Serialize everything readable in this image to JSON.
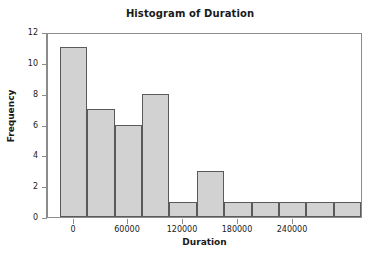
{
  "chart_data": {
    "type": "bar",
    "title": "Histogram of Duration",
    "xlabel": "Duration",
    "ylabel": "Frequency",
    "subtitle": "",
    "grid": false,
    "legend": null,
    "bin_width": 30000,
    "bin_edges": [
      -15000,
      15000,
      45000,
      75000,
      105000,
      135000,
      165000,
      195000,
      225000,
      255000,
      285000,
      315000
    ],
    "bin_centers": [
      0,
      30000,
      60000,
      90000,
      120000,
      150000,
      180000,
      210000,
      240000,
      270000,
      300000
    ],
    "values": [
      11,
      7,
      6,
      8,
      1,
      3,
      1,
      1,
      1,
      1,
      1
    ],
    "categories": [
      "0",
      "30000",
      "60000",
      "90000",
      "120000",
      "150000",
      "180000",
      "210000",
      "240000",
      "270000",
      "300000"
    ],
    "xlim": [
      -28000,
      317000
    ],
    "ylim": [
      0,
      12
    ],
    "xticks": [
      0,
      60000,
      120000,
      180000,
      240000
    ],
    "xticklabels": [
      "0",
      "60000",
      "120000",
      "180000",
      "240000"
    ],
    "yticks": [
      0,
      2,
      4,
      6,
      8,
      10,
      12
    ],
    "yticklabels": [
      "0",
      "2",
      "4",
      "6",
      "8",
      "10",
      "12"
    ],
    "bar_fill_color": "#d2d2d2",
    "bar_edge_color": "#5a5a5a",
    "axis_color": "#8c8c8c",
    "text_color": "#1a1a1a",
    "background_color": "#ffffff"
  }
}
